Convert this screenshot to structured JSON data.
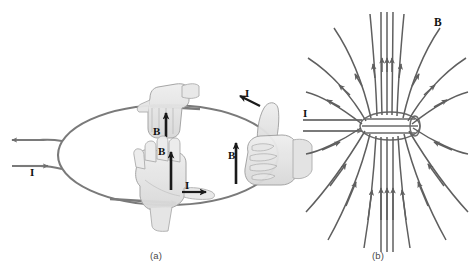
{
  "figure": {
    "background_color": "#ffffff",
    "line_color": "#6e6e6e",
    "field_line_color": "#5f5f5f",
    "hand_fill": "#e3e3e3",
    "hand_stroke": "#9a9a9a",
    "label_color": "#111111",
    "caption_color": "#4a4a4a"
  },
  "panels": [
    {
      "id": "a",
      "caption": "(a)",
      "description": "Current loop with right-hand-rule hands",
      "labels": [
        {
          "name": "lead-current-label",
          "text": "I",
          "x": 30,
          "y": 167
        },
        {
          "name": "top-hand-b-label",
          "text": "B",
          "x": 153,
          "y": 126
        },
        {
          "name": "palm-hand-b-label",
          "text": "B",
          "x": 158,
          "y": 146
        },
        {
          "name": "palm-hand-i-label",
          "text": "I",
          "x": 185,
          "y": 180
        },
        {
          "name": "fist-hand-i-label",
          "text": "I",
          "x": 245,
          "y": 88
        },
        {
          "name": "fist-hand-b-label",
          "text": "B",
          "x": 228,
          "y": 150
        }
      ]
    },
    {
      "id": "b",
      "caption": "(b)",
      "description": "Magnetic field lines of the current loop",
      "labels": [
        {
          "name": "solenoid-current-label",
          "text": "I",
          "x": 303,
          "y": 108
        },
        {
          "name": "field-label",
          "text": "B",
          "x": 434,
          "y": 17
        }
      ]
    }
  ],
  "captions": {
    "panel_a": "(a)",
    "panel_b": "(b)"
  },
  "symbols": {
    "current": "I",
    "magnetic_field": "B"
  }
}
